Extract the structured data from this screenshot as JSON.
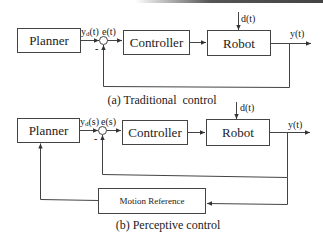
{
  "diagrams": [
    {
      "id": "a",
      "caption": "(a) Traditional  control",
      "blocks": {
        "planner": "Planner",
        "controller": "Controller",
        "robot": "Robot"
      },
      "signals": {
        "reference": "yd(t)",
        "reference_base": "y",
        "reference_sub": "d",
        "reference_arg": "(t)",
        "error": "e(t)",
        "disturbance": "d(t)",
        "output": "y(t)",
        "minus_sign": "-"
      }
    },
    {
      "id": "b",
      "caption": "(b) Perceptive control",
      "blocks": {
        "planner": "Planner",
        "controller": "Controller",
        "robot": "Robot",
        "motion_reference": "Motion Reference"
      },
      "signals": {
        "reference": "yd(s)",
        "reference_base": "y",
        "reference_sub": "d",
        "reference_arg": "(s)",
        "error": "e(s)",
        "disturbance": "d(t)",
        "output": "y(t)",
        "minus_sign": "-"
      }
    }
  ],
  "colors": {
    "line": "#444444",
    "text": "#222222",
    "background": "#ffffff"
  }
}
